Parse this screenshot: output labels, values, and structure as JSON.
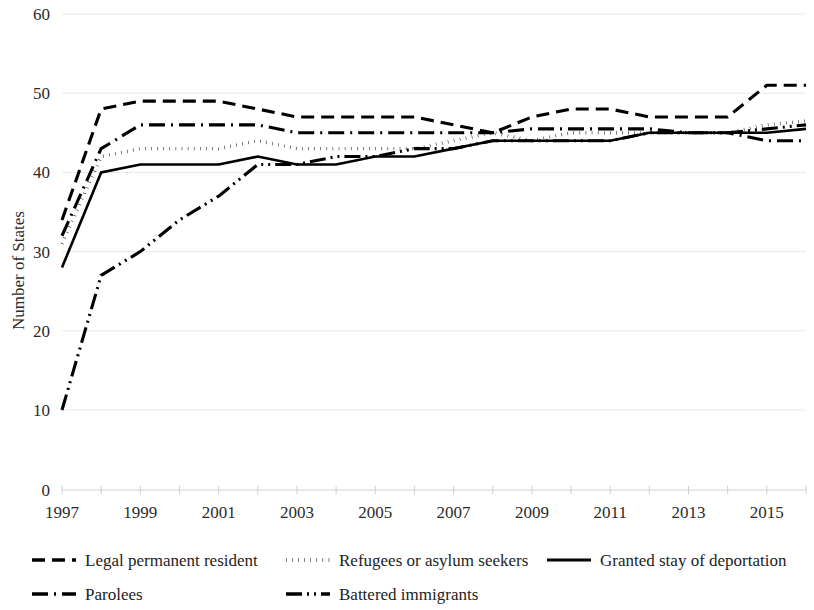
{
  "chart_data": {
    "type": "line",
    "title": "",
    "xlabel": "",
    "ylabel": "Number of States",
    "xlim": [
      1997,
      2016
    ],
    "ylim": [
      0,
      60
    ],
    "y_ticks": [
      0,
      10,
      20,
      30,
      40,
      50,
      60
    ],
    "x_ticks": [
      1997,
      1999,
      2001,
      2003,
      2005,
      2007,
      2009,
      2011,
      2013,
      2015
    ],
    "x_tick_labels": [
      "1997",
      "1999",
      "2001",
      "2003",
      "2005",
      "2007",
      "2009",
      "2011",
      "2013",
      "2015"
    ],
    "y_tick_labels": [
      "0",
      "10",
      "20",
      "30",
      "40",
      "50",
      "60"
    ],
    "grid": true,
    "grid_axis": "y",
    "legend_position": "bottom",
    "x": [
      1997,
      1998,
      1999,
      2000,
      2001,
      2002,
      2003,
      2004,
      2005,
      2006,
      2007,
      2008,
      2009,
      2010,
      2011,
      2012,
      2013,
      2014,
      2015,
      2016
    ],
    "series": [
      {
        "name": "Legal permanent resident",
        "dash_style": "dashed",
        "color": "#000000",
        "values": [
          34,
          48,
          49,
          49,
          49,
          48,
          47,
          47,
          47,
          47,
          46,
          45,
          47,
          48,
          48,
          47,
          47,
          47,
          51,
          51
        ]
      },
      {
        "name": "Refugees or asylum seekers",
        "dash_style": "dotted",
        "color": "#000000",
        "values": [
          31,
          42,
          43,
          43,
          43,
          44,
          43,
          43,
          43,
          43,
          44,
          45,
          44,
          45,
          45,
          45,
          45,
          45,
          46,
          46.5
        ]
      },
      {
        "name": "Granted stay of deportation",
        "dash_style": "solid",
        "color": "#000000",
        "values": [
          28,
          40,
          41,
          41,
          41,
          42,
          41,
          41,
          42,
          42,
          43,
          44,
          44,
          44,
          44,
          45,
          45,
          45,
          45,
          45.5
        ]
      },
      {
        "name": "Parolees",
        "dash_style": "dash-dot",
        "color": "#000000",
        "values": [
          32,
          43,
          46,
          46,
          46,
          46,
          45,
          45,
          45,
          45,
          45,
          45,
          45.5,
          45.5,
          45.5,
          45.5,
          45,
          45,
          44,
          44
        ]
      },
      {
        "name": "Battered immigrants",
        "dash_style": "dash-dot-dot",
        "color": "#000000",
        "values": [
          10,
          27,
          30,
          34,
          37,
          41,
          41,
          42,
          42,
          43,
          43,
          44,
          44,
          44,
          44,
          45,
          45,
          45,
          45.5,
          46
        ]
      }
    ],
    "legend": [
      {
        "label": "Legal permanent resident",
        "dash_style": "dashed"
      },
      {
        "label": "Refugees or asylum seekers",
        "dash_style": "dotted"
      },
      {
        "label": "Granted stay of deportation",
        "dash_style": "solid"
      },
      {
        "label": "Parolees",
        "dash_style": "dash-dot"
      },
      {
        "label": "Battered immigrants",
        "dash_style": "dash-dot-dot"
      }
    ]
  }
}
